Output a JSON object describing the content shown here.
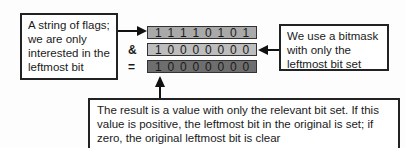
{
  "left_note": {
    "lines": [
      "A string of flags;",
      "we are only",
      "interested in the",
      "leftmost bit"
    ]
  },
  "right_note": {
    "lines": [
      "We use a bitmask",
      "with only the",
      "leftmost bit set"
    ]
  },
  "bottom_note": {
    "lines": [
      "The result is a value with only the relevant bit set. If this",
      "value is positive, the leftmost bit in the original is set; if",
      "zero, the original leftmost bit is clear"
    ]
  },
  "operators": {
    "and": "&",
    "equals": "="
  },
  "rows": [
    {
      "name": "flags",
      "bits": [
        "1",
        "1",
        "1",
        "1",
        "0",
        "1",
        "0",
        "1"
      ],
      "color": "#a9a9a9"
    },
    {
      "name": "mask",
      "bits": [
        "1",
        "0",
        "0",
        "0",
        "0",
        "0",
        "0",
        "0"
      ],
      "color": "#b9b9b9"
    },
    {
      "name": "result",
      "bits": [
        "1",
        "0",
        "0",
        "0",
        "0",
        "0",
        "0",
        "0"
      ],
      "color": "#6e6e6e"
    }
  ]
}
